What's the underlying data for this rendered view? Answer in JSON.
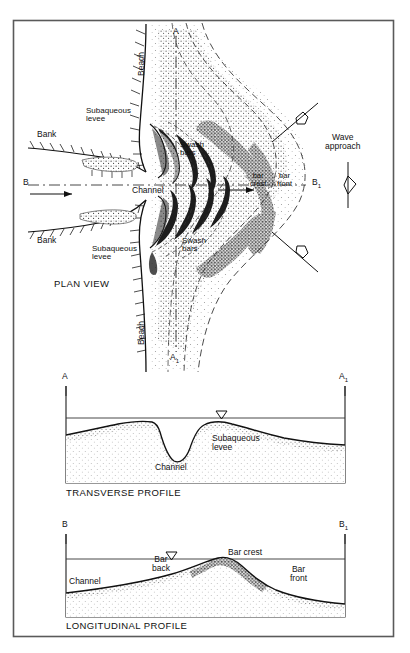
{
  "figure": {
    "kind": "geomorphology-diagram",
    "title_absent": true,
    "frame": {
      "x": 13,
      "y": 20,
      "w": 381,
      "h": 617
    }
  },
  "plan_view": {
    "section_label": "PLAN VIEW",
    "labels": {
      "beach_top": "Beach",
      "beach_bottom": "Beach",
      "bank_top": "Bank",
      "bank_bottom": "Bank",
      "subaqueous_levee_top": "Subaqueous\nlevee",
      "subaqueous_levee_bottom": "Subaqueous\nlevee",
      "swash_bars_top": "Swash\nbars",
      "swash_bars_bottom": "Swash\nbars",
      "channel": "Channel",
      "bar_crest": "bar\ncrest",
      "bar_front": "bar\nfront",
      "wave_approach": "Wave\napproach"
    },
    "section_markers": {
      "a_top": "A",
      "a_bottom": "A",
      "a_bottom_sub": "1",
      "b_left": "B",
      "b_right": "B",
      "b_right_sub": "1"
    }
  },
  "transverse_profile": {
    "caption": "TRANSVERSE PROFILE",
    "left_marker": "A",
    "right_marker": "A",
    "right_marker_sub": "1",
    "labels": {
      "subaqueous_levee": "Subaqueous\nlevee",
      "channel": "Channel"
    },
    "water_level_symbol": "water-surface-triangle"
  },
  "longitudinal_profile": {
    "caption": "LONGITUDINAL PROFILE",
    "left_marker": "B",
    "right_marker": "B",
    "right_marker_sub": "1",
    "labels": {
      "channel": "Channel",
      "bar_back": "Bar\nback",
      "bar_crest": "Bar crest",
      "bar_front": "Bar\nfront"
    },
    "water_level_symbol": "water-surface-triangle"
  },
  "colors": {
    "ink": "#111111",
    "frame": "#4a4a4a",
    "stipple": "#3a3a3a",
    "background": "#ffffff"
  }
}
